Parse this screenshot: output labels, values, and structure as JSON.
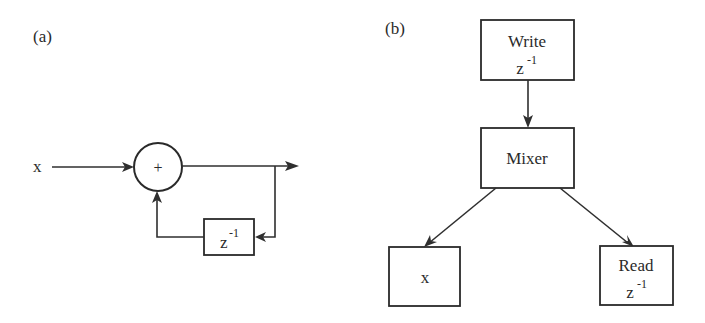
{
  "panel_a": {
    "label": "(a)",
    "input_label": "x",
    "adder_symbol": "+",
    "delay_block": {
      "base": "z",
      "exponent": "-1"
    }
  },
  "panel_b": {
    "label": "(b)",
    "write_block": {
      "title": "Write",
      "base": "z",
      "exponent": "-1"
    },
    "mixer_block": {
      "title": "Mixer"
    },
    "x_block": {
      "title": "x"
    },
    "read_block": {
      "title": "Read",
      "base": "z",
      "exponent": "-1"
    }
  },
  "colors": {
    "ink": "#2a2a2a",
    "background": "#ffffff"
  }
}
